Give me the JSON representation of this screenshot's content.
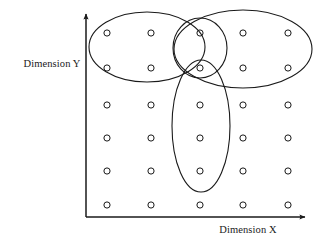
{
  "figure": {
    "title": "",
    "background_color": "#ffffff",
    "stroke_color": "#1a1a1a",
    "axes": {
      "x_label": "Dimension X",
      "y_label": "Dimension Y",
      "origin": {
        "x": 86,
        "y": 217
      },
      "x_axis_end": {
        "x": 308,
        "y": 217
      },
      "y_axis_end": {
        "x": 86,
        "y": 11
      },
      "x_label_pos": {
        "x": 248,
        "y": 232
      },
      "y_label_pos": {
        "x": 52,
        "y": 67
      }
    }
  },
  "chart_data": {
    "type": "scatter",
    "title": "",
    "xlabel": "Dimension X",
    "ylabel": "Dimension Y",
    "grid": false,
    "legend": "none",
    "marker": "open-circle",
    "columns_x": [
      107,
      151,
      200,
      243,
      288
    ],
    "rows_y": [
      33,
      68,
      105,
      138,
      171,
      205
    ],
    "point_count": 30,
    "points": [
      {
        "x": 107,
        "y": 33
      },
      {
        "x": 151,
        "y": 33
      },
      {
        "x": 200,
        "y": 33
      },
      {
        "x": 243,
        "y": 33
      },
      {
        "x": 288,
        "y": 33
      },
      {
        "x": 107,
        "y": 68
      },
      {
        "x": 151,
        "y": 68
      },
      {
        "x": 200,
        "y": 68
      },
      {
        "x": 243,
        "y": 68
      },
      {
        "x": 288,
        "y": 68
      },
      {
        "x": 107,
        "y": 105
      },
      {
        "x": 151,
        "y": 105
      },
      {
        "x": 200,
        "y": 105
      },
      {
        "x": 243,
        "y": 105
      },
      {
        "x": 288,
        "y": 105
      },
      {
        "x": 107,
        "y": 138
      },
      {
        "x": 151,
        "y": 138
      },
      {
        "x": 200,
        "y": 138
      },
      {
        "x": 243,
        "y": 138
      },
      {
        "x": 288,
        "y": 138
      },
      {
        "x": 107,
        "y": 171
      },
      {
        "x": 151,
        "y": 171
      },
      {
        "x": 200,
        "y": 171
      },
      {
        "x": 243,
        "y": 171
      },
      {
        "x": 288,
        "y": 171
      },
      {
        "x": 107,
        "y": 205
      },
      {
        "x": 151,
        "y": 205
      },
      {
        "x": 200,
        "y": 205
      },
      {
        "x": 243,
        "y": 205
      },
      {
        "x": 288,
        "y": 205
      }
    ],
    "annotations": {
      "type": "cluster-ellipses",
      "count": 4,
      "ellipses": [
        {
          "name": "left-horizontal-ellipse",
          "cx": 147,
          "cy": 47,
          "rx": 58,
          "ry": 35,
          "rotation": 0
        },
        {
          "name": "right-horizontal-ellipse",
          "cx": 243,
          "cy": 49,
          "rx": 69,
          "ry": 39,
          "rotation": 0
        },
        {
          "name": "center-small-ellipse",
          "cx": 200,
          "cy": 48,
          "rx": 27,
          "ry": 30,
          "rotation": 0
        },
        {
          "name": "center-vertical-ellipse",
          "cx": 201,
          "cy": 126,
          "rx": 29,
          "ry": 66,
          "rotation": 0
        }
      ]
    }
  }
}
